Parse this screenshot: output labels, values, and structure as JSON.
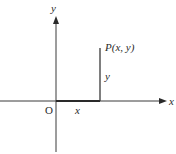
{
  "diagram": {
    "type": "cartesian-coordinate-diagram",
    "axes": {
      "x_label": "x",
      "y_label": "y",
      "origin_label": "O"
    },
    "point": {
      "label": "P(x, y)"
    },
    "segments": {
      "horizontal_label": "x",
      "vertical_label": "y"
    },
    "colors": {
      "line": "#3a3a3a",
      "text": "#2a2a2a",
      "background": "#ffffff"
    }
  }
}
